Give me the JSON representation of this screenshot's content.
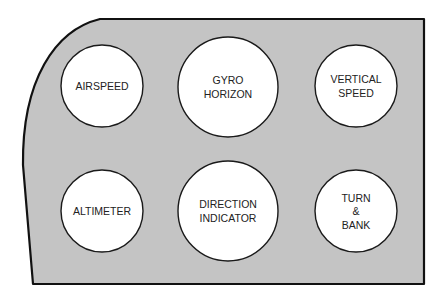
{
  "diagram": {
    "panel": {
      "fill": "#c4c4c4",
      "stroke": "#111111"
    },
    "instruments": [
      {
        "id": "airspeed",
        "lines": [
          "AIRSPEED"
        ],
        "cx": 102,
        "cy": 86,
        "r": 41
      },
      {
        "id": "gyro-horizon",
        "lines": [
          "GYRO",
          "HORIZON"
        ],
        "cx": 228,
        "cy": 87,
        "r": 50
      },
      {
        "id": "vertical-speed",
        "lines": [
          "VERTICAL",
          "SPEED"
        ],
        "cx": 356,
        "cy": 86,
        "r": 41
      },
      {
        "id": "altimeter",
        "lines": [
          "ALTIMETER"
        ],
        "cx": 102,
        "cy": 211,
        "r": 41
      },
      {
        "id": "direction-indicator",
        "lines": [
          "DIRECTION",
          "INDICATOR"
        ],
        "cx": 228,
        "cy": 211,
        "r": 50
      },
      {
        "id": "turn-and-bank",
        "lines": [
          "TURN",
          "&",
          "BANK"
        ],
        "cx": 356,
        "cy": 211,
        "r": 41
      }
    ]
  }
}
